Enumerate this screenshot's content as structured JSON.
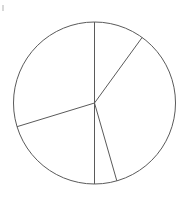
{
  "figure": {
    "background_color": "#ffffff",
    "width": 184,
    "height": 201,
    "title": "",
    "stray_mark_label": "stray-pixel-artifact"
  },
  "chart_data": {
    "type": "pie",
    "title": "",
    "subtitle": "",
    "xlabel": "",
    "ylabel": "",
    "legend": [],
    "legend_position": "none",
    "grid": false,
    "labels": [
      "",
      "",
      "",
      "",
      ""
    ],
    "values": [
      36,
      128,
      16,
      73,
      107
    ],
    "value_unit": "degrees",
    "fractions": [
      0.1,
      0.3556,
      0.0444,
      0.2028,
      0.2972
    ],
    "start_angle_deg": 0,
    "direction": "clockwise",
    "slice_boundary_angles_deg": [
      0,
      36,
      164,
      180,
      253,
      360
    ],
    "colors": [
      "#ffffff",
      "#ffffff",
      "#ffffff",
      "#ffffff",
      "#ffffff"
    ],
    "edge_color": "#5a5a5a",
    "edge_width": 1,
    "center_x": 94.5,
    "center_y": 103,
    "radius": 81,
    "slice_count": 5
  },
  "geometry": {
    "circle": {
      "cx": 94.5,
      "cy": 103,
      "r": 81
    },
    "spokes": [
      {
        "name": "spoke-up",
        "angle_deg": 0,
        "x2": 94.5,
        "y2": 22
      },
      {
        "name": "spoke-upper-right",
        "angle_deg": 36,
        "x2": 142.1,
        "y2": 37.5
      },
      {
        "name": "spoke-lower-right",
        "angle_deg": 164,
        "x2": 116.8,
        "y2": 185.1
      },
      {
        "name": "spoke-down",
        "angle_deg": 180,
        "x2": 94.5,
        "y2": 184
      },
      {
        "name": "spoke-left",
        "angle_deg": 253,
        "x2": 17.0,
        "y2": 126.7
      }
    ]
  }
}
